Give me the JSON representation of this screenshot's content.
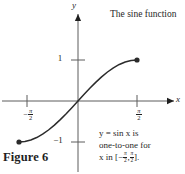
{
  "figure": {
    "label": "Figure 6",
    "caption_title": "The sine function",
    "background_color": "#ffffff",
    "ink_color": "#1f1f1f"
  },
  "annotation": {
    "line1": "y = sin x is",
    "line2": "one-to-one for",
    "line3_prefix": "x in [−",
    "line3_suffix": "].",
    "pi_symbol": "π",
    "denominator": "2",
    "comma": ","
  },
  "axes": {
    "x_label": "x",
    "y_label": "y",
    "x_ticks": [
      {
        "name": "neg-half-pi",
        "sign": "−",
        "pi": "π",
        "den": "2",
        "x_px": 27
      },
      {
        "name": "pos-half-pi",
        "sign": "",
        "pi": "π",
        "den": "2",
        "x_px": 137
      }
    ],
    "y_ticks": [
      {
        "name": "one",
        "label": "1",
        "y_px": 60
      },
      {
        "name": "minus-one",
        "label": "−1",
        "y_px": 142
      }
    ],
    "origin_px": {
      "x": 78,
      "y": 101
    }
  },
  "chart_data": {
    "type": "line",
    "title": "The sine function",
    "xlabel": "x",
    "ylabel": "y",
    "xlim": [
      -2.1,
      2.6
    ],
    "ylim": [
      -1.55,
      1.65
    ],
    "grid": false,
    "legend": null,
    "function": "y = sin x",
    "domain_restriction": "[-pi/2, pi/2]",
    "x_tick_values": [
      -1.5708,
      1.5708
    ],
    "x_tick_labels": [
      "−π/2",
      "π/2"
    ],
    "y_tick_values": [
      -1,
      1
    ],
    "y_tick_labels": [
      "−1",
      "1"
    ],
    "series": [
      {
        "name": "y = sin x",
        "color": "#2b2b2b",
        "endpoints_marked": true,
        "x": [
          -1.5708,
          -1.4137,
          -1.2566,
          -1.0996,
          -0.9425,
          -0.7854,
          -0.6283,
          -0.4712,
          -0.3142,
          -0.1571,
          0.0,
          0.1571,
          0.3142,
          0.4712,
          0.6283,
          0.7854,
          0.9425,
          1.0996,
          1.2566,
          1.4137,
          1.5708
        ],
        "y": [
          -1.0,
          -0.9877,
          -0.9511,
          -0.891,
          -0.809,
          -0.7071,
          -0.5878,
          -0.454,
          -0.309,
          -0.1564,
          0.0,
          0.1564,
          0.309,
          0.454,
          0.5878,
          0.7071,
          0.809,
          0.891,
          0.9511,
          0.9877,
          1.0
        ]
      }
    ],
    "markers": [
      {
        "name": "left-endpoint",
        "x": -1.5708,
        "y": -1.0
      },
      {
        "name": "right-endpoint",
        "x": 1.5708,
        "y": 1.0
      }
    ],
    "annotations": [
      {
        "name": "caption-title",
        "text": "The sine function"
      },
      {
        "name": "property-note",
        "text": "y = sin x is one-to-one for x in [−π/2, π/2]."
      }
    ]
  }
}
